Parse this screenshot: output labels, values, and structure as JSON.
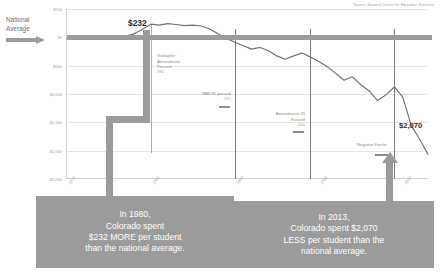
{
  "source_note": "Source: National Center for Education Statistics",
  "legend": {
    "national_average_line1": "National",
    "national_average_line2": "Average",
    "arrow_icon": "right-arrow-icon"
  },
  "callouts": {
    "peak_value": "$232",
    "trough_value": "$2,070"
  },
  "events": [
    {
      "label_line1": "Gallagher",
      "label_line2": "Amendment",
      "label_line3": "Passed",
      "year": "1982"
    },
    {
      "label_line1": "TABOR passed",
      "label_line2": "",
      "label_line3": "",
      "year": "1992"
    },
    {
      "label_line1": "Amendment 23",
      "label_line2": "Passed",
      "label_line3": "",
      "year": "2000"
    },
    {
      "label_line1": "Negative Factor",
      "label_line2": "",
      "label_line3": "",
      "year": "2010"
    }
  ],
  "captions": {
    "left": {
      "line1": "In 1980,",
      "line2": "Colorado spent",
      "line3": "$232 MORE per student",
      "line4": "than the national average."
    },
    "right": {
      "line1": "In 2013,",
      "line2": "Colorado spent $2,070",
      "line3": "LESS per student than the",
      "line4": "national average."
    }
  },
  "colors": {
    "band": "#9b9b9b",
    "series": "#6f6f6f",
    "grid": "#e4e4e4",
    "caption_bg": "#9b9b9b",
    "callout_text": "#2b2b2b"
  },
  "chart_data": {
    "type": "line",
    "title": "",
    "subtitle": "",
    "xlabel": "",
    "ylabel": "",
    "grid": true,
    "legend_position": "left",
    "ylim": [
      -2500,
      500
    ],
    "ytick_labels": [
      "$500",
      "$0",
      "-$500",
      "-$1,000",
      "-$1,500",
      "-$2,000",
      "-$2,500"
    ],
    "ytick_values": [
      500,
      0,
      -500,
      -1000,
      -1500,
      -2000,
      -2500
    ],
    "xlim": [
      1970,
      2013
    ],
    "xtick_labels": [
      "1970",
      "1980",
      "1990",
      "2000",
      "2010"
    ],
    "xtick_values": [
      1970,
      1980,
      1990,
      2000,
      2010
    ],
    "series": [
      {
        "name": "Colorado per-student spending difference from national average",
        "x": [
          1970,
          1971,
          1972,
          1973,
          1974,
          1975,
          1976,
          1977,
          1978,
          1979,
          1980,
          1981,
          1982,
          1983,
          1984,
          1985,
          1986,
          1987,
          1988,
          1989,
          1990,
          1991,
          1992,
          1993,
          1994,
          1995,
          1996,
          1997,
          1998,
          1999,
          2000,
          2001,
          2002,
          2003,
          2004,
          2005,
          2006,
          2007,
          2008,
          2009,
          2010,
          2011,
          2012,
          2013
        ],
        "values": [
          -30,
          -40,
          -25,
          -35,
          -20,
          -30,
          -10,
          20,
          60,
          140,
          232,
          215,
          240,
          225,
          205,
          215,
          200,
          145,
          60,
          -20,
          -90,
          -150,
          -210,
          -180,
          -240,
          -330,
          -390,
          -330,
          -280,
          -350,
          -430,
          -520,
          -640,
          -760,
          -700,
          -840,
          -950,
          -1120,
          -1020,
          -880,
          -1060,
          -1560,
          -1800,
          -2070
        ]
      },
      {
        "name": "National average baseline",
        "x": [
          1970,
          2013
        ],
        "values": [
          0,
          0
        ]
      }
    ],
    "annotations": [
      {
        "text": "$232",
        "x": 1980,
        "y": 232
      },
      {
        "text": "$2,070",
        "x": 2013,
        "y": -2070
      },
      {
        "text": "Gallagher Amendment Passed",
        "x": 1982
      },
      {
        "text": "TABOR passed",
        "x": 1992
      },
      {
        "text": "Amendment 23 Passed",
        "x": 2000
      },
      {
        "text": "Negative Factor",
        "x": 2010
      }
    ]
  }
}
